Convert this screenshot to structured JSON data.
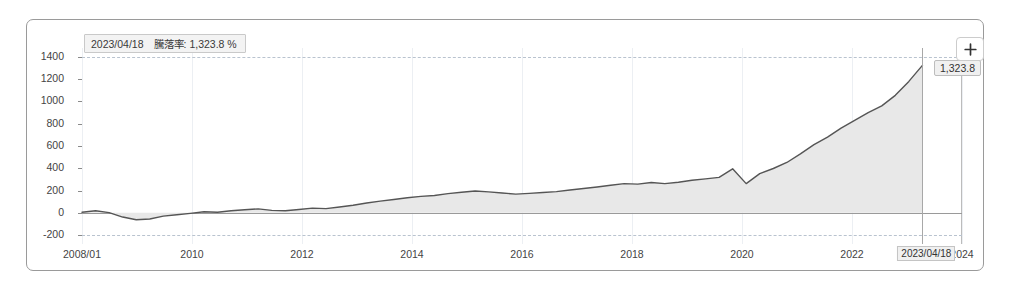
{
  "chart_data": {
    "type": "line",
    "title": "",
    "xlabel": "",
    "ylabel": "",
    "ylim": [
      -280,
      1480
    ],
    "yticks": [
      1400,
      1200,
      1000,
      800,
      600,
      400,
      200,
      0,
      -200
    ],
    "xticks": [
      "2008/01",
      "2010",
      "2012",
      "2014",
      "2016",
      "2018",
      "2020",
      "2022",
      "2024"
    ],
    "xlim": [
      "2008-01",
      "2024-06"
    ],
    "grid": true,
    "legend": null,
    "series": [
      {
        "name": "騰落率",
        "unit": "%",
        "x": [
          "2008/01",
          "2008/04",
          "2008/07",
          "2008/10",
          "2009/01",
          "2009/04",
          "2009/07",
          "2009/10",
          "2010/01",
          "2010/04",
          "2010/07",
          "2010/10",
          "2011/01",
          "2011/04",
          "2011/07",
          "2011/10",
          "2012/01",
          "2012/04",
          "2012/07",
          "2012/10",
          "2013/01",
          "2013/04",
          "2013/07",
          "2013/10",
          "2014/01",
          "2014/04",
          "2014/07",
          "2014/10",
          "2015/01",
          "2015/04",
          "2015/07",
          "2015/10",
          "2016/01",
          "2016/04",
          "2016/07",
          "2016/10",
          "2017/01",
          "2017/04",
          "2017/07",
          "2017/10",
          "2018/01",
          "2018/04",
          "2018/07",
          "2018/10",
          "2019/01",
          "2019/04",
          "2019/07",
          "2019/10",
          "2020/01",
          "2020/03",
          "2020/06",
          "2020/09",
          "2020/12",
          "2021/03",
          "2021/06",
          "2021/09",
          "2021/12",
          "2022/03",
          "2022/06",
          "2022/09",
          "2022/12",
          "2023/02",
          "2023/04/18"
        ],
        "values": [
          5,
          18,
          2,
          -38,
          -62,
          -55,
          -30,
          -18,
          -5,
          10,
          5,
          18,
          28,
          35,
          22,
          18,
          30,
          42,
          38,
          52,
          68,
          88,
          105,
          120,
          135,
          148,
          155,
          172,
          185,
          196,
          188,
          178,
          168,
          175,
          182,
          190,
          205,
          218,
          232,
          248,
          262,
          258,
          272,
          262,
          275,
          292,
          305,
          318,
          395,
          262,
          352,
          398,
          452,
          530,
          612,
          680,
          760,
          830,
          900,
          960,
          1055,
          1180,
          1323.8
        ],
        "color": "#555555",
        "fill_color": "#e8e8e8"
      }
    ],
    "highlight": {
      "date": "2023/04/18",
      "metric_label": "騰落率",
      "value": "1,323.8",
      "unit": "%",
      "value_callout": "1,323.8",
      "axis_callout": "2023/04/18"
    }
  },
  "toolbar": {
    "expand_icon": "plus-icon",
    "expand_label": "+"
  },
  "tooltip": {
    "date": "2023/04/18",
    "metric": "騰落率: 1,323.8 %"
  },
  "colors": {
    "line": "#555555",
    "area": "#e9e9e9",
    "zero_line": "#9a9a9a",
    "grid": "#eceff3",
    "dashed_grid": "#b9c3cf",
    "border": "#9a9a9a",
    "text": "#444444"
  }
}
